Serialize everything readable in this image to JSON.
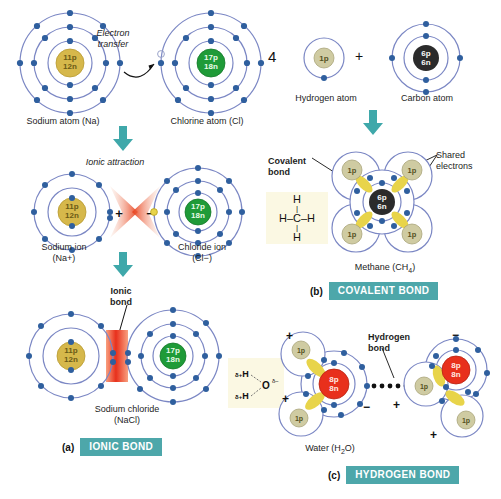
{
  "figure": {
    "background": "#ffffff",
    "accent_teal": "#4da7aa",
    "nucleus_colors": {
      "sodium": "#d6b84b",
      "chlorine": "#1f9b38",
      "carbon": "#2b2b2b",
      "oxygen": "#e8301c",
      "hydrogen": "#cfcba2"
    },
    "electron_color": "#2f5f9e",
    "shell_color": "#7b87c4",
    "shared_electron_color": "#e8d44a"
  },
  "panel_a": {
    "section_letter": "(a)",
    "section_name": "IONIC BOND",
    "step1": {
      "annotation": "Electron\ntransfer",
      "annotation_line1": "Electron",
      "annotation_line2": "transfer",
      "left_atom": {
        "nucleus_line1": "11p",
        "nucleus_line2": "12n",
        "caption": "Sodium atom (Na)",
        "shells": [
          2,
          8,
          1
        ]
      },
      "right_atom": {
        "nucleus_line1": "17p",
        "nucleus_line2": "18n",
        "caption": "Chlorine atom (Cl)",
        "shells": [
          2,
          8,
          7
        ]
      }
    },
    "step2": {
      "annotation": "Ionic attraction",
      "left_ion": {
        "nucleus_line1": "11p",
        "nucleus_line2": "12n",
        "caption_line1": "Sodium ion",
        "caption_line2": "(Na+)",
        "charge": "+",
        "shells": [
          2,
          8
        ]
      },
      "right_ion": {
        "nucleus_line1": "17p",
        "nucleus_line2": "18n",
        "caption_line1": "Chloride ion",
        "caption_line2": "(Cl−)",
        "charge": "−",
        "shells": [
          2,
          8,
          8
        ]
      }
    },
    "step3": {
      "annotation_line1": "Ionic",
      "annotation_line2": "bond",
      "left_ion": {
        "nucleus_line1": "11p",
        "nucleus_line2": "12n"
      },
      "right_ion": {
        "nucleus_line1": "17p",
        "nucleus_line2": "18n"
      },
      "caption_line1": "Sodium chloride",
      "caption_line2": "(NaCl)"
    }
  },
  "panel_b": {
    "section_letter": "(b)",
    "section_name": "COVALENT BOND",
    "step1": {
      "multiplier": "4",
      "plus": "+",
      "hydrogen": {
        "nucleus": "1p",
        "caption": "Hydrogen atom"
      },
      "carbon": {
        "nucleus_line1": "6p",
        "nucleus_line2": "6n",
        "caption": "Carbon atom"
      }
    },
    "step2": {
      "label_covalent_line1": "Covalent",
      "label_covalent_line2": "bond",
      "label_shared_line1": "Shared",
      "label_shared_line2": "electrons",
      "center_nucleus_line1": "6p",
      "center_nucleus_line2": "6n",
      "hydrogen_nucleus": "1p",
      "structural_formula": {
        "top": "H",
        "middle_left": "H",
        "center": "C",
        "middle_right": "H",
        "bottom": "H"
      },
      "caption": "Methane (CH₄)",
      "caption_base": "Methane (CH",
      "caption_sub": "4",
      "caption_end": ")"
    }
  },
  "panel_c": {
    "section_letter": "(c)",
    "section_name": "HYDROGEN BOND",
    "label_hydrogen_line1": "Hydrogen",
    "label_hydrogen_line2": "bond",
    "left_molecule": {
      "oxygen_line1": "8p",
      "oxygen_line2": "8n",
      "hydrogen_nucleus": "1p",
      "charges": [
        "+",
        "+",
        "−"
      ]
    },
    "right_molecule": {
      "oxygen_line1": "8p",
      "oxygen_line2": "8n",
      "hydrogen_nucleus": "1p",
      "charges": [
        "−",
        "+",
        "+"
      ]
    },
    "structural_formula": {
      "h_top": "H",
      "h_bottom": "H",
      "o": "O",
      "delta_plus": "δ+",
      "delta_minus": "δ−"
    },
    "caption": "Water (H₂O)",
    "caption_base": "Water (H",
    "caption_sub": "2",
    "caption_end": "O)"
  }
}
